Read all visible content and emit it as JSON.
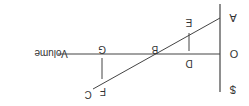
{
  "diagram": {
    "orientation": "rotated-180",
    "title": "",
    "axes": {
      "vertical_label": "$",
      "origin_label": "O",
      "horizontal_label": "Volume"
    },
    "points": {
      "A": "A",
      "B": "B",
      "C": "C",
      "D": "D",
      "E": "E",
      "F": "F",
      "G": "G"
    },
    "line_color": "#444444",
    "text_color": "#333333"
  }
}
